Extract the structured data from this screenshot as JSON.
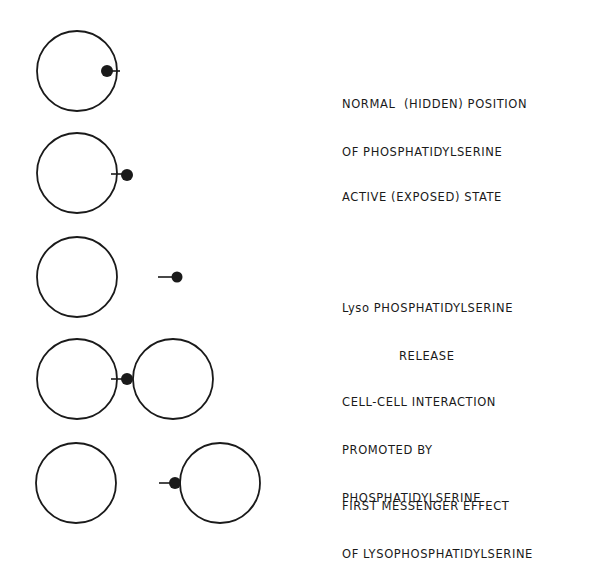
{
  "diagram": {
    "stroke_color": "#1a1a1a",
    "rows": [
      {
        "id": "normal",
        "lines": [
          "NORMAL  (HIDDEN) POSITION",
          "OF PHOSPHATIDYLSERINE"
        ],
        "cells": [
          {
            "cx": 77,
            "cy": 71,
            "r": 40
          }
        ],
        "molecule": {
          "head_x": 107,
          "head_y": 71,
          "tail_x2": 120
        }
      },
      {
        "id": "active",
        "lines": [
          "ACTIVE (EXPOSED) STATE"
        ],
        "cells": [
          {
            "cx": 77,
            "cy": 173,
            "r": 40
          }
        ],
        "molecule": {
          "head_x": 127,
          "head_y": 175,
          "tail_x1": 112
        }
      },
      {
        "id": "lyso-release",
        "lines": [
          "Lyso PHOSPHATIDYLSERINE",
          "RELEASE"
        ],
        "cells": [
          {
            "cx": 77,
            "cy": 277,
            "r": 40
          }
        ],
        "molecule": {
          "head_x": 177,
          "head_y": 277,
          "tail_x1": 158
        }
      },
      {
        "id": "cell-cell",
        "lines": [
          "CELL-CELL INTERACTION",
          "PROMOTED BY",
          "PHOSPHATIDYLSERINE"
        ],
        "cells": [
          {
            "cx": 77,
            "cy": 379,
            "r": 40
          },
          {
            "cx": 173,
            "cy": 379,
            "r": 40
          }
        ],
        "molecule": {
          "head_x": 127,
          "head_y": 379,
          "tail_x1": 112
        }
      },
      {
        "id": "first-messenger",
        "lines": [
          "FIRST MESSENGER EFFECT",
          "OF LYSOPHOSPHATIDYLSERINE"
        ],
        "cells": [
          {
            "cx": 76,
            "cy": 483,
            "r": 40
          },
          {
            "cx": 220,
            "cy": 483,
            "r": 40
          }
        ],
        "molecule": {
          "head_x": 175,
          "head_y": 483,
          "tail_x1": 160
        }
      }
    ]
  }
}
